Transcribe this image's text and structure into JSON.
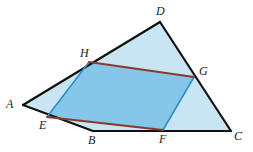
{
  "figure": {
    "type": "geometry-diagram",
    "width": 253,
    "height": 152,
    "background": "#ffffff",
    "colors": {
      "outer_fill": "#c9e4f3",
      "inner_fill": "#86c6e9",
      "outer_stroke": "#111111",
      "red_stroke": "#8b3a2a",
      "blue_stroke": "#2d8fc9",
      "label_color": "#1a1a1a"
    },
    "points": {
      "A": {
        "x": 23,
        "y": 105
      },
      "B": {
        "x": 93,
        "y": 131
      },
      "C": {
        "x": 231,
        "y": 131
      },
      "D": {
        "x": 160,
        "y": 22
      },
      "E": {
        "x": 47,
        "y": 117
      },
      "F": {
        "x": 163,
        "y": 130
      },
      "G": {
        "x": 194,
        "y": 77
      },
      "H": {
        "x": 89,
        "y": 62
      }
    },
    "outer_polygon": "23,105 160,22 231,131 93,131",
    "inner_polygon": "47,117 163,130 194,77 89,62",
    "segments": [
      {
        "name": "side-AD",
        "from": "A",
        "to": "D",
        "path": "M 23 105 L 160 22",
        "stroke": "#111111",
        "width": 2.2
      },
      {
        "name": "side-DC",
        "from": "D",
        "to": "C",
        "path": "M 160 22 L 231 131",
        "stroke": "#111111",
        "width": 2.2
      },
      {
        "name": "side-BC",
        "from": "B",
        "to": "C",
        "path": "M 93 131 L 231 131",
        "stroke": "#111111",
        "width": 2.2
      },
      {
        "name": "side-AB",
        "from": "A",
        "to": "B",
        "path": "M 23 105 L 93 131",
        "stroke": "#111111",
        "width": 2.2
      },
      {
        "name": "segment-HG",
        "from": "H",
        "to": "G",
        "path": "M 89 62 L 194 77",
        "stroke": "#8b3a2a",
        "width": 1.8
      },
      {
        "name": "segment-EF",
        "from": "E",
        "to": "F",
        "path": "M 47 117 L 163 130",
        "stroke": "#8b3a2a",
        "width": 1.8
      },
      {
        "name": "segment-HE",
        "from": "H",
        "to": "E",
        "path": "M 89 62 L 47 117",
        "stroke": "#2d8fc9",
        "width": 1.6
      },
      {
        "name": "segment-GF",
        "from": "G",
        "to": "F",
        "path": "M 194 77 L 163 130",
        "stroke": "#2d8fc9",
        "width": 1.6
      }
    ],
    "labels": [
      {
        "id": "A",
        "text": "A",
        "x": 6,
        "y": 98
      },
      {
        "id": "B",
        "text": "B",
        "x": 88,
        "y": 134
      },
      {
        "id": "C",
        "text": "C",
        "x": 234,
        "y": 130
      },
      {
        "id": "D",
        "text": "D",
        "x": 156,
        "y": 5
      },
      {
        "id": "E",
        "text": "E",
        "x": 39,
        "y": 119
      },
      {
        "id": "F",
        "text": "F",
        "x": 159,
        "y": 133
      },
      {
        "id": "G",
        "text": "G",
        "x": 199,
        "y": 65
      },
      {
        "id": "H",
        "text": "H",
        "x": 80,
        "y": 47
      }
    ]
  }
}
